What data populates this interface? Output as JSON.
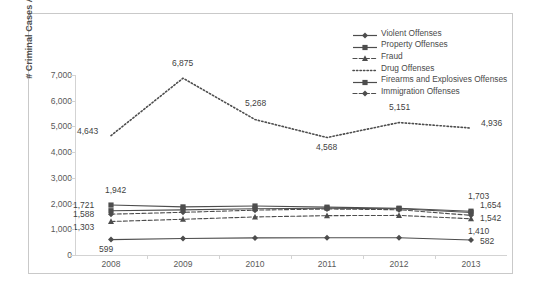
{
  "chart_data": {
    "type": "line",
    "title": "",
    "xlabel": "",
    "ylabel": "# Criminal Cases Appealed",
    "categories": [
      "2008",
      "2009",
      "2010",
      "2011",
      "2012",
      "2013"
    ],
    "ylim": [
      0,
      7000
    ],
    "yticks": [
      "0",
      "1,000",
      "2,000",
      "3,000",
      "4,000",
      "5,000",
      "6,000",
      "7,000"
    ],
    "ytick_values": [
      0,
      1000,
      2000,
      3000,
      4000,
      5000,
      6000,
      7000
    ],
    "grid": false,
    "legend_position": "top-right",
    "series": [
      {
        "name": "Violent Offenses",
        "marker": "diamond",
        "line": "solid",
        "values": [
          599,
          640,
          665,
          672,
          668,
          582
        ],
        "labels": [
          {
            "year": "2008",
            "text": "599"
          },
          {
            "year": "2013",
            "text": "582"
          }
        ]
      },
      {
        "name": "Property Offenses",
        "marker": "square",
        "line": "solid",
        "values": [
          1721,
          1755,
          1800,
          1820,
          1800,
          1654
        ],
        "labels": [
          {
            "year": "2008",
            "text": "1,721"
          },
          {
            "year": "2013",
            "text": "1,654"
          }
        ]
      },
      {
        "name": "Fraud",
        "marker": "triangle",
        "line": "dashed",
        "values": [
          1303,
          1390,
          1480,
          1530,
          1540,
          1410
        ],
        "labels": [
          {
            "year": "2008",
            "text": "1,303"
          },
          {
            "year": "2013",
            "text": "1,410"
          }
        ]
      },
      {
        "name": "Drug Offenses",
        "marker": "none",
        "line": "dotted",
        "values": [
          4643,
          6875,
          5268,
          4568,
          5151,
          4936
        ],
        "labels": [
          {
            "year": "2008",
            "text": "4,643"
          },
          {
            "year": "2009",
            "text": "6,875"
          },
          {
            "year": "2010",
            "text": "5,268"
          },
          {
            "year": "2011",
            "text": "4,568"
          },
          {
            "year": "2012",
            "text": "5,151"
          },
          {
            "year": "2013",
            "text": "4,936"
          }
        ]
      },
      {
        "name": "Firearms and Explosives Offenses",
        "marker": "square",
        "line": "solid",
        "values": [
          1942,
          1870,
          1905,
          1860,
          1820,
          1703
        ],
        "labels": [
          {
            "year": "2008",
            "text": "1,942"
          },
          {
            "year": "2013",
            "text": "1,703"
          }
        ]
      },
      {
        "name": "Immigration Offenses",
        "marker": "diamond",
        "line": "dashed",
        "values": [
          1588,
          1660,
          1745,
          1790,
          1760,
          1542
        ],
        "labels": [
          {
            "year": "2008",
            "text": "1,588"
          },
          {
            "year": "2013",
            "text": "1,542"
          }
        ]
      }
    ],
    "colors": {
      "line": "#4d4d4d",
      "text": "#4a4a4a",
      "axis": "#d3d3d3",
      "border": "#c9c9c9"
    }
  }
}
